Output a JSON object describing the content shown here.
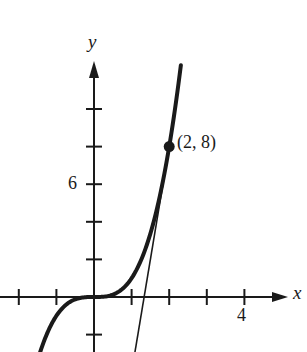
{
  "chart_data": {
    "type": "line",
    "title": "",
    "xlabel": "x",
    "ylabel": "y",
    "xlim": [
      -2.5,
      5.3
    ],
    "ylim": [
      -2.9,
      12.3
    ],
    "grid": false,
    "x_ticks": [
      -2,
      -1,
      1,
      2,
      3,
      4
    ],
    "x_tick_labels": [
      {
        "value": 4,
        "label": "4"
      }
    ],
    "y_ticks": [
      -2,
      2,
      4,
      6,
      8,
      10
    ],
    "y_tick_labels": [
      {
        "value": 6,
        "label": "6"
      }
    ],
    "series": [
      {
        "name": "curve y = x^3",
        "style": "thick",
        "function": "x^3",
        "x_range": [
          -1.43,
          2.31
        ]
      },
      {
        "name": "tangent line at (2, 8)",
        "style": "thin",
        "function": "12x - 16",
        "x_range": [
          1.09,
          2.0
        ]
      }
    ],
    "annotations": [
      {
        "type": "point",
        "x": 2,
        "y": 8,
        "label": "(2, 8)"
      }
    ]
  },
  "labels": {
    "x_axis": "x",
    "y_axis": "y",
    "tick_4": "4",
    "tick_6": "6",
    "point": "(2, 8)"
  }
}
